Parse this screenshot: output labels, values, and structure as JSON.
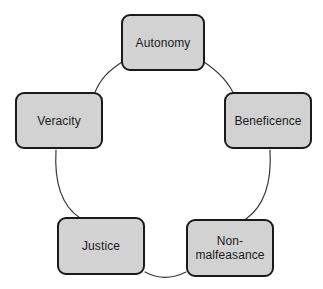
{
  "diagram": {
    "type": "cycle",
    "title": "",
    "background_color": "#ffffff",
    "node_fill_color": "#d2d2d2",
    "node_border_color": "#1a1a1a",
    "connector_color": "#3a3a3a",
    "text_color": "#1b1b1b",
    "nodes": [
      {
        "id": "autonomy",
        "label": "Autonomy"
      },
      {
        "id": "beneficence",
        "label": "Beneficence"
      },
      {
        "id": "non-malfeasance",
        "label": "Non-\nmalfeasance"
      },
      {
        "id": "justice",
        "label": "Justice"
      },
      {
        "id": "veracity",
        "label": "Veracity"
      }
    ],
    "connections": [
      {
        "from": "autonomy",
        "to": "beneficence"
      },
      {
        "from": "beneficence",
        "to": "non-malfeasance"
      },
      {
        "from": "non-malfeasance",
        "to": "justice"
      },
      {
        "from": "justice",
        "to": "veracity"
      },
      {
        "from": "veracity",
        "to": "autonomy"
      }
    ]
  }
}
